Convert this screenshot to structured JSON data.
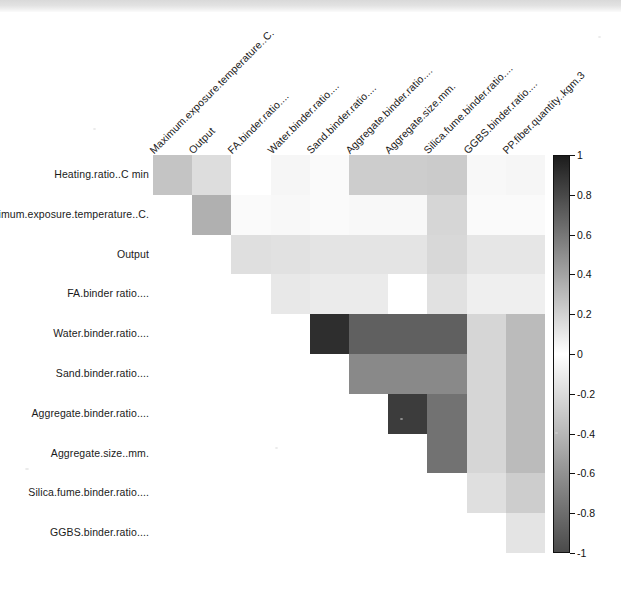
{
  "figure": {
    "type": "correlation-heatmap",
    "background": "#ffffff"
  },
  "chart_data": {
    "type": "heatmap",
    "title": "",
    "xlabel": "",
    "ylabel": "",
    "grid": false,
    "legend_position": "right",
    "colorbar": {
      "label": "",
      "min": -1,
      "max": 1,
      "ticks": [
        1,
        0.8,
        0.6,
        0.4,
        0.2,
        0,
        -0.2,
        -0.4,
        -0.6,
        -0.8,
        -1
      ],
      "tick_labels": [
        "1",
        "0.8",
        "0.6",
        "0.4",
        "0.2",
        "0",
        "-0.2",
        "-0.4",
        "-0.6",
        "-0.8",
        "-1"
      ],
      "colormap": "grey-diverging",
      "color_at_max": "#1c1c1c",
      "color_at_mid": "#ffffff",
      "color_at_min": "#4a4a4a"
    },
    "row_labels": [
      "Heating.ratio..C min",
      "Maximum.exposure.temperature..C.",
      "Output",
      "FA.binder ratio....",
      "Water.binder.ratio....",
      "Sand.binder.ratio....",
      "Aggregate.binder.ratio....",
      "Aggregate.size..mm.",
      "Silica.fume.binder.ratio....",
      "GGBS.binder.ratio...."
    ],
    "col_labels": [
      "Maximum.exposure.temperature..C.",
      "Output",
      "FA.binder.ratio....",
      "Water.binder.ratio....",
      "Sand.binder.ratio....",
      "Aggregate.binder.ratio....",
      "Aggregate.size.mm.",
      "Silica.fume.binder.ratio....",
      "GGBS.binder.ratio....",
      "PP.fiber.quantity..kgm.3"
    ],
    "upper_triangle_only": true,
    "values": [
      [
        0.26,
        0.15,
        0.0,
        0.04,
        0.02,
        0.22,
        0.22,
        0.23,
        0.03,
        0.04
      ],
      [
        null,
        0.35,
        0.02,
        0.03,
        0.02,
        0.03,
        0.03,
        0.18,
        0.02,
        0.02
      ],
      [
        null,
        null,
        0.14,
        0.13,
        0.12,
        0.12,
        0.12,
        0.17,
        0.11,
        0.11
      ],
      [
        null,
        null,
        null,
        0.1,
        0.09,
        0.09,
        0.0,
        0.13,
        0.07,
        0.07
      ],
      [
        null,
        null,
        null,
        null,
        0.92,
        0.7,
        0.7,
        0.7,
        0.18,
        0.3
      ],
      [
        null,
        null,
        null,
        null,
        null,
        0.52,
        0.52,
        0.52,
        0.18,
        0.3
      ],
      [
        null,
        null,
        null,
        null,
        null,
        null,
        0.86,
        0.62,
        0.18,
        0.3
      ],
      [
        null,
        null,
        null,
        null,
        null,
        null,
        null,
        0.62,
        0.18,
        0.3
      ],
      [
        null,
        null,
        null,
        null,
        null,
        null,
        null,
        null,
        0.14,
        0.22
      ],
      [
        null,
        null,
        null,
        null,
        null,
        null,
        null,
        null,
        null,
        0.12
      ]
    ]
  }
}
